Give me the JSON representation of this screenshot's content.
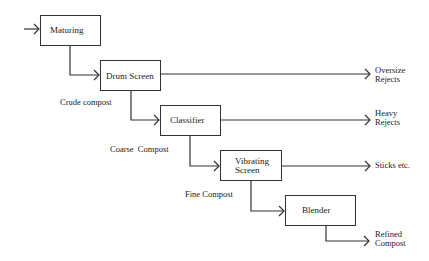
{
  "diagram": {
    "nodes": [
      {
        "id": "maturing",
        "label": "Maturing"
      },
      {
        "id": "drum_screen",
        "label": "Drum Screen"
      },
      {
        "id": "classifier",
        "label": "Classifier"
      },
      {
        "id": "vibrating_screen",
        "label_line1": "Vibrating",
        "label_line2": "Screen"
      },
      {
        "id": "blender",
        "label": "Blender"
      }
    ],
    "flow_labels": {
      "crude": "Crude compost",
      "coarse": "Coarse  Compost",
      "fine": "Fine Compost"
    },
    "outputs": {
      "oversize_line1": "Oversize",
      "oversize_line2": "Rejects",
      "heavy_line1": "Heavy",
      "heavy_line2": "Rejects",
      "sticks": "Sticks etc.",
      "refined_line1": "Refined",
      "refined_line2": "Compost"
    },
    "edges": [
      {
        "from": "input",
        "to": "maturing"
      },
      {
        "from": "maturing",
        "to": "drum_screen",
        "label": "Crude compost"
      },
      {
        "from": "drum_screen",
        "to": "oversize_rejects"
      },
      {
        "from": "drum_screen",
        "to": "classifier"
      },
      {
        "from": "classifier",
        "to": "heavy_rejects"
      },
      {
        "from": "classifier",
        "to": "vibrating_screen",
        "label": "Coarse Compost"
      },
      {
        "from": "vibrating_screen",
        "to": "sticks"
      },
      {
        "from": "vibrating_screen",
        "to": "blender",
        "label": "Fine Compost"
      },
      {
        "from": "blender",
        "to": "refined_compost"
      }
    ]
  }
}
